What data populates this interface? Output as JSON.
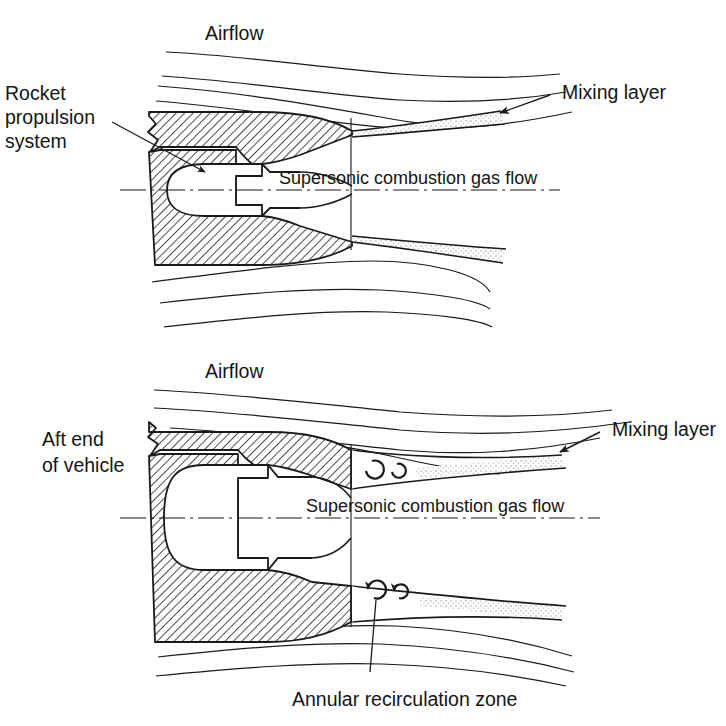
{
  "figure": {
    "background_color": "#ffffff",
    "line_color": "#1a1a1a",
    "hatch_color": "#222222",
    "mixing_layer_fill": "#d9d9d9"
  },
  "panels": [
    {
      "id": "upper",
      "name": "pointed-boattail-configuration",
      "labels": {
        "airflow": "Airflow",
        "mixing_layer": "Mixing layer",
        "centerline_flow": "Supersonic combustion gas flow",
        "left_callout_line1": "Rocket",
        "left_callout_line2": "propulsion",
        "left_callout_line3": "system"
      }
    },
    {
      "id": "lower",
      "name": "blunt-base-configuration",
      "labels": {
        "airflow": "Airflow",
        "mixing_layer": "Mixing layer",
        "centerline_flow": "Supersonic combustion gas flow",
        "left_callout_line1": "Aft end",
        "left_callout_line2": "of vehicle",
        "bottom_callout": "Annular recirculation zone"
      }
    }
  ],
  "icons": {
    "arrowhead": "arrowhead-icon",
    "vortex": "vortex-swirl-icon",
    "break_line": "break-line-icon",
    "centerline": "center-dash-dot-line-icon"
  }
}
